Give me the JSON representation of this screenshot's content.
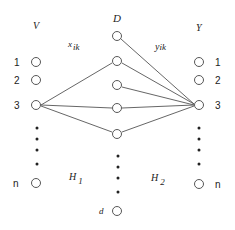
{
  "diagram": {
    "columns": {
      "V": {
        "label": "V",
        "x": 36,
        "label_y": 29
      },
      "D": {
        "label": "D",
        "x": 117,
        "label_y": 22
      },
      "Y": {
        "label": "Y",
        "x": 199,
        "label_y": 31
      }
    },
    "v_nodes": [
      {
        "label": "1",
        "y": 62
      },
      {
        "label": "2",
        "y": 80
      },
      {
        "label": "3",
        "y": 105
      },
      {
        "label": "n",
        "y": 183
      }
    ],
    "d_nodes": [
      {
        "y": 36
      },
      {
        "y": 61
      },
      {
        "y": 85
      },
      {
        "y": 108
      },
      {
        "y": 134
      },
      {
        "label": "d",
        "y": 211
      }
    ],
    "y_nodes": [
      {
        "label": "1",
        "y": 62
      },
      {
        "label": "2",
        "y": 80
      },
      {
        "label": "3",
        "y": 105
      },
      {
        "label": "n",
        "y": 183
      }
    ],
    "edge_labels": {
      "x": {
        "base": "x",
        "sub": "ik"
      },
      "y": {
        "base": "y",
        "sub": "ik"
      }
    },
    "region_labels": {
      "h1": {
        "base": "H",
        "sub": "1"
      },
      "h2": {
        "base": "H",
        "sub": "2"
      }
    },
    "edges_v3_to_d": [
      61,
      85,
      108,
      134
    ],
    "edges_d_to_y3": [
      36,
      61,
      85,
      108,
      134
    ],
    "colors": {
      "stroke": "#444444",
      "text": "#222222",
      "background": "#ffffff"
    }
  }
}
